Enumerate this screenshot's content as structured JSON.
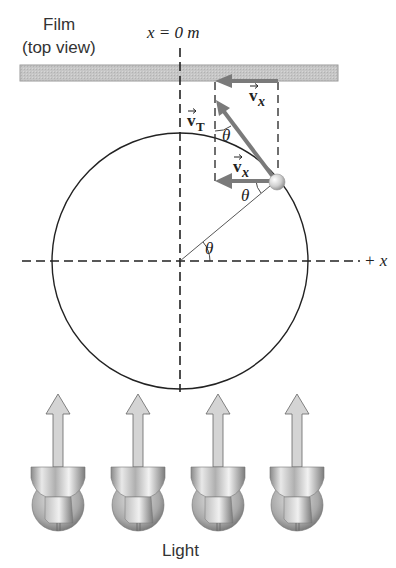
{
  "labels": {
    "film_line1": "Film",
    "film_line2": "(top view)",
    "origin": "x = 0 m",
    "plus_x": "+ x",
    "light": "Light",
    "vT_main": "v",
    "vT_sub": "T",
    "vx_top_main": "v",
    "vx_top_sub": "x",
    "vx_mid_main": "v",
    "vx_mid_sub": "x",
    "theta_top": "θ",
    "theta_ball": "θ",
    "theta_center": "θ"
  },
  "geometry": {
    "circle_center": [
      180,
      261
    ],
    "circle_radius": 128,
    "ball_position": [
      276,
      181
    ],
    "film_rect": [
      20,
      65,
      318,
      16
    ],
    "light_centers_x": [
      58,
      138,
      218,
      297
    ]
  },
  "colors": {
    "film_fill": "#c9c9c9",
    "arrow_gray": "#7a7a7a",
    "line_dark": "#222222",
    "light_arrow_fill": "#d4d4d4"
  }
}
